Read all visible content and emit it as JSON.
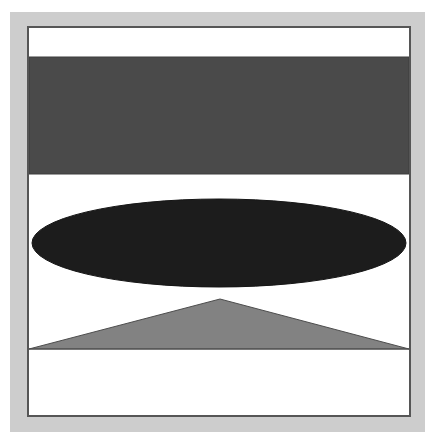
{
  "figure": {
    "canvas": {
      "width": 439,
      "height": 446,
      "background_color": "#ffffff",
      "margin_color": "#cdcdcd"
    },
    "frame": {
      "name": "plate-frame",
      "x": 27,
      "y": 26,
      "width": 384,
      "height": 391,
      "fill_color": "#ffffff",
      "border_color": "#565656",
      "border_width": 2
    }
  },
  "shapes": [
    {
      "id": "rectangle-band",
      "label": "Dark gray rectangular band",
      "type": "rectangle",
      "x": 0,
      "y": 29,
      "width": 380,
      "height": 117,
      "fill_color": "#4a4a4a",
      "stroke_color": "#3d3d3d",
      "stroke_width": 1
    },
    {
      "id": "ellipse-flat",
      "label": "Flattened black ellipse",
      "type": "ellipse",
      "cx": 190,
      "cy": 215,
      "rx": 187,
      "ry": 44,
      "fill_color": "#1c1c1c",
      "stroke_color": "#161616",
      "stroke_width": 1
    },
    {
      "id": "triangle-low",
      "label": "Light gray obtuse triangle",
      "type": "triangle",
      "points": "0,321 191,271 380,321",
      "apex_x": 191,
      "apex_y": 271,
      "base_y": 321,
      "fill_color": "#828282",
      "stroke_color": "#4d4d4d",
      "stroke_width": 1
    },
    {
      "id": "baseline-rule",
      "label": "Horizontal base rule under triangle",
      "type": "line",
      "x1": 0,
      "y1": 321,
      "x2": 380,
      "y2": 321,
      "stroke_color": "#4d4d4d",
      "stroke_width": 1
    }
  ],
  "palette": {
    "background": "#ffffff",
    "margin": "#cdcdcd",
    "frame_border": "#565656",
    "rectangle_gray": "#4a4a4a",
    "ellipse_black": "#1c1c1c",
    "triangle_gray": "#828282",
    "outline": "#4d4d4d"
  }
}
